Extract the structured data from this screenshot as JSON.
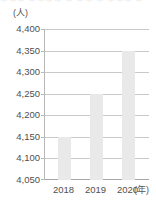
{
  "top_cut_text": "＊＊＊ ＊＊＊＊ ＊ ＊＊ ＊ ＊＊＊ ＊",
  "chart_data": {
    "type": "bar",
    "title": "",
    "subtitle": "",
    "xlabel": "(年)",
    "ylabel": "(人)",
    "categories": [
      "2018",
      "2019",
      "2020"
    ],
    "values": [
      4150,
      4250,
      4350
    ],
    "series": [
      {
        "name": "",
        "values": [
          4150,
          4250,
          4350
        ]
      }
    ],
    "ylim": [
      4050,
      4400
    ],
    "ytick_step": 50,
    "yticks": [
      4400,
      4350,
      4300,
      4250,
      4200,
      4150,
      4100,
      4050
    ],
    "ytick_labels": [
      "4,400",
      "4,350",
      "4,300",
      "4,250",
      "4,200",
      "4,150",
      "4,100",
      "4,050"
    ],
    "xtick_labels": [
      "2018",
      "2019",
      "2020"
    ],
    "grid": true,
    "grid_axis": "y",
    "legend": false,
    "legend_position": "none",
    "annotations": [],
    "colors": {
      "bar_fill": "#e9e9e9",
      "gridline": "#c9c9c9",
      "axis_line": "#b9b9b9",
      "baseline": "#a8a8a8",
      "label_text": "#4f4f4f",
      "unit_text": "#555555",
      "background": "#ffffff"
    }
  }
}
